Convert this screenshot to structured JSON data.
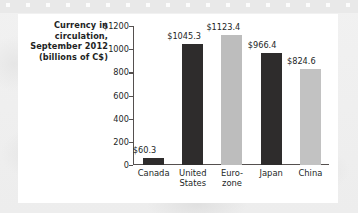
{
  "card": {
    "background_color": "#ffffff"
  },
  "chart_data": {
    "type": "bar",
    "title": "Currency in circulation, September 2012 (billions of C$)",
    "title_lines": [
      "Currency in",
      "circulation,",
      "September 2012",
      "(billions of C$)"
    ],
    "xlabel": "",
    "ylabel": "",
    "categories": [
      "Canada",
      "United States",
      "Euro-zone",
      "Japan",
      "China"
    ],
    "category_lines": [
      [
        "Canada"
      ],
      [
        "United",
        "States"
      ],
      [
        "Euro-",
        "zone"
      ],
      [
        "Japan"
      ],
      [
        "China"
      ]
    ],
    "values": [
      60.3,
      1045.3,
      1123.4,
      966.4,
      824.6
    ],
    "value_labels": [
      "$60.3",
      "$1045.3",
      "$1123.4",
      "$966.4",
      "$824.6"
    ],
    "ylim": [
      0,
      1200
    ],
    "ytick_values": [
      1200,
      1000,
      800,
      600,
      400,
      200,
      0
    ],
    "ytick_labels": [
      "$1200",
      "1000",
      "800",
      "600",
      "400",
      "200",
      "0"
    ],
    "grid": false,
    "legend": false,
    "bar_colors": [
      "#2e2c2c",
      "#2e2c2c",
      "#bdbdbd",
      "#2e2c2c",
      "#c2c2c2"
    ],
    "axis_color": "#55504f",
    "text_color": "#231f1f"
  }
}
